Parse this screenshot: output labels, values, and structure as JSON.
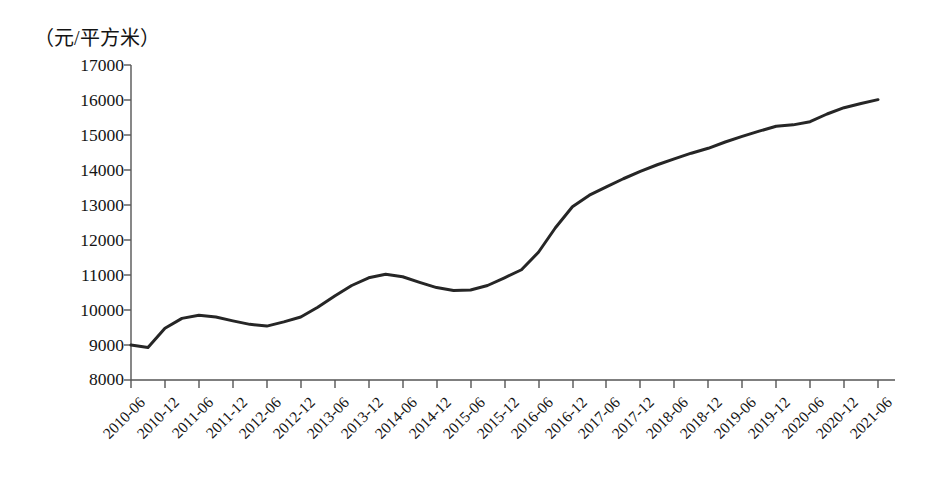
{
  "chart_data": {
    "type": "line",
    "title": "",
    "subtitle": "",
    "xlabel": "",
    "ylabel": "（元/平方米）",
    "unit_note": "（元/平方米）",
    "ylim": [
      8000,
      17000
    ],
    "ytick_step": 1000,
    "grid": false,
    "legend": null,
    "legend_position": "none",
    "line_color": "#262626",
    "line_width": 3,
    "markers": false,
    "ytick_labels": [
      "17000",
      "16000",
      "15000",
      "14000",
      "13000",
      "12000",
      "11000",
      "10000",
      "9000",
      "8000"
    ],
    "ytick_values": [
      17000,
      16000,
      15000,
      14000,
      13000,
      12000,
      11000,
      10000,
      9000,
      8000
    ],
    "categories": [
      "2010-06",
      "2010-12",
      "2011-06",
      "2011-12",
      "2012-06",
      "2012-12",
      "2013-06",
      "2013-12",
      "2014-06",
      "2014-12",
      "2015-06",
      "2015-12",
      "2016-06",
      "2016-12",
      "2017-06",
      "2017-12",
      "2018-06",
      "2018-12",
      "2019-06",
      "2019-12",
      "2020-06",
      "2020-12",
      "2021-06"
    ],
    "values": [
      9000,
      9500,
      9850,
      9700,
      9550,
      9800,
      10400,
      10900,
      10950,
      10650,
      10580,
      10900,
      11600,
      12950,
      13500,
      13950,
      14300,
      14620,
      14950,
      15250,
      15350,
      15750,
      16000
    ],
    "dense_series": {
      "name": "房价",
      "x_months": [
        "2010-06",
        "2010-09",
        "2010-12",
        "2011-03",
        "2011-06",
        "2011-09",
        "2011-12",
        "2012-03",
        "2012-06",
        "2012-09",
        "2012-12",
        "2013-03",
        "2013-06",
        "2013-09",
        "2013-12",
        "2014-03",
        "2014-06",
        "2014-09",
        "2014-12",
        "2015-03",
        "2015-06",
        "2015-09",
        "2015-12",
        "2016-03",
        "2016-06",
        "2016-09",
        "2016-12",
        "2017-03",
        "2017-06",
        "2017-09",
        "2017-12",
        "2018-03",
        "2018-06",
        "2018-09",
        "2018-12",
        "2019-03",
        "2019-06",
        "2019-09",
        "2019-12",
        "2020-03",
        "2020-06",
        "2020-09",
        "2020-12",
        "2021-03",
        "2021-06"
      ],
      "y_values": [
        9000,
        8930,
        9480,
        9760,
        9850,
        9800,
        9690,
        9590,
        9540,
        9660,
        9800,
        10080,
        10400,
        10700,
        10920,
        11020,
        10950,
        10790,
        10640,
        10560,
        10570,
        10700,
        10920,
        11150,
        11650,
        12350,
        12950,
        13280,
        13520,
        13750,
        13960,
        14150,
        14320,
        14480,
        14620,
        14800,
        14960,
        15110,
        15250,
        15290,
        15380,
        15600,
        15780,
        15900,
        16010
      ]
    }
  },
  "axes": {
    "y_axis_name": "price-axis",
    "x_axis_name": "time-axis",
    "tick_direction": "outward"
  }
}
